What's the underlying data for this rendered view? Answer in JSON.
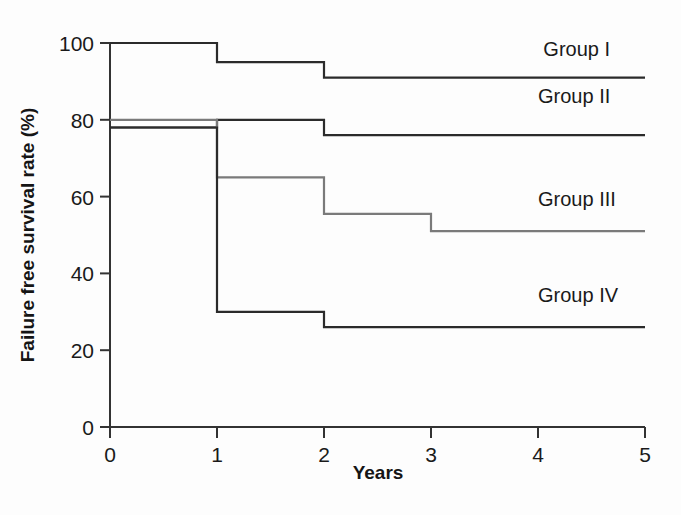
{
  "chart_data": {
    "type": "line",
    "title": "",
    "xlabel": "Years",
    "ylabel": "Failure free survival rate (%)",
    "xlim": [
      0,
      5
    ],
    "ylim": [
      0,
      100
    ],
    "x_ticks": [
      "0",
      "1",
      "2",
      "3",
      "4",
      "5"
    ],
    "y_ticks": [
      "0",
      "20",
      "40",
      "60",
      "80",
      "100"
    ],
    "grid": false,
    "legend_position": "inline-right",
    "step_style": "post",
    "series": [
      {
        "name": "Group I",
        "color": "#2b2b2b",
        "label_x": 4.05,
        "label_y": 96.5,
        "x": [
          0,
          1,
          2,
          5
        ],
        "values": [
          100,
          95,
          91,
          91
        ],
        "points": [
          {
            "year": 0,
            "rate": 100
          },
          {
            "year": 1,
            "rate": 95
          },
          {
            "year": 2,
            "rate": 91
          },
          {
            "year": 5,
            "rate": 91
          }
        ]
      },
      {
        "name": "Group II",
        "color": "#2b2b2b",
        "label_x": 4.0,
        "label_y": 84.5,
        "x": [
          0,
          1,
          2,
          5
        ],
        "values": [
          78,
          80,
          76,
          76
        ],
        "points": [
          {
            "year": 0,
            "rate": 78
          },
          {
            "year": 1,
            "rate": 80
          },
          {
            "year": 2,
            "rate": 76
          },
          {
            "year": 5,
            "rate": 76
          }
        ]
      },
      {
        "name": "Group III",
        "color": "#7a7a7a",
        "label_x": 4.0,
        "label_y": 57.5,
        "x": [
          0,
          1,
          2,
          3,
          5
        ],
        "values": [
          80,
          65,
          55.5,
          51,
          51
        ],
        "points": [
          {
            "year": 0,
            "rate": 80
          },
          {
            "year": 1,
            "rate": 65
          },
          {
            "year": 2,
            "rate": 55.5
          },
          {
            "year": 3,
            "rate": 51
          },
          {
            "year": 5,
            "rate": 51
          }
        ]
      },
      {
        "name": "Group IV",
        "color": "#2b2b2b",
        "label_x": 4.0,
        "label_y": 32.5,
        "x": [
          0,
          1,
          2,
          5
        ],
        "values": [
          78,
          30,
          26,
          26
        ],
        "points": [
          {
            "year": 0,
            "rate": 78
          },
          {
            "year": 1,
            "rate": 30
          },
          {
            "year": 2,
            "rate": 26
          },
          {
            "year": 5,
            "rate": 26
          }
        ]
      }
    ]
  },
  "axes": {
    "x_axis_label": "Years",
    "y_axis_label": "Failure free survival rate (%)",
    "x_tick_labels": [
      "0",
      "1",
      "2",
      "3",
      "4",
      "5"
    ],
    "y_tick_labels": [
      "0",
      "20",
      "40",
      "60",
      "80",
      "100"
    ],
    "axis_color": "#333333"
  },
  "labels": {
    "group1": "Group I",
    "group2": "Group II",
    "group3": "Group III",
    "group4": "Group IV"
  }
}
